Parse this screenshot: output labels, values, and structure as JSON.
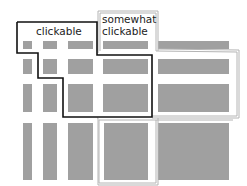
{
  "diagram": {
    "labels": {
      "clickable": "clickable",
      "somewhat_line1": "somewhat",
      "somewhat_line2": "clickable"
    },
    "colors": {
      "cell": "#a0a0a0",
      "clickable_outline": "#111111",
      "somewhat_outline": "#b4b4b4",
      "background": "#ffffff"
    },
    "grid": {
      "columns": 5,
      "rows": 4
    }
  }
}
